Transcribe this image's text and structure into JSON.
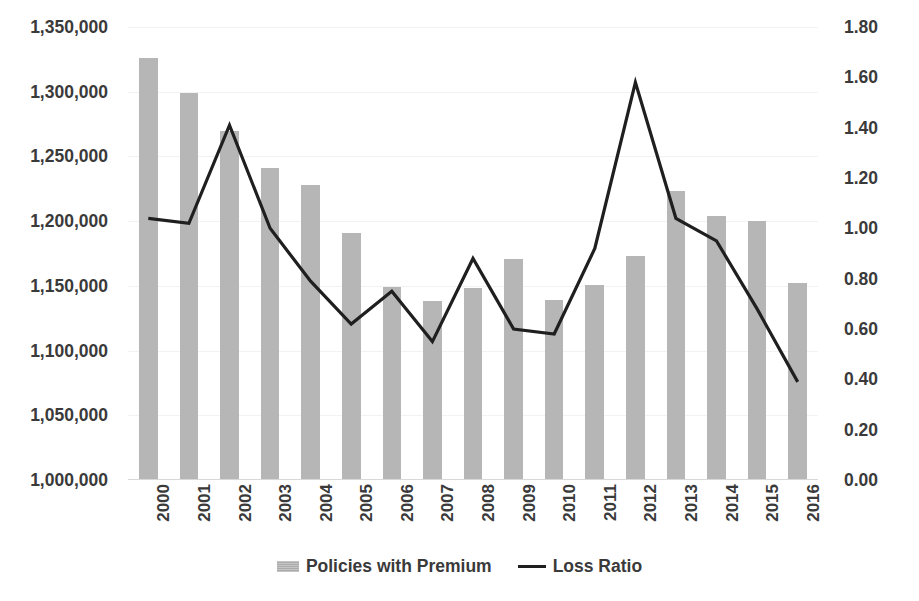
{
  "chart_data": {
    "type": "bar",
    "title": "",
    "xlabel": "",
    "ylabel": "",
    "grid": true,
    "legend_position": "bottom",
    "categories": [
      "2000",
      "2001",
      "2002",
      "2003",
      "2004",
      "2005",
      "2006",
      "2007",
      "2008",
      "2009",
      "2010",
      "2011",
      "2012",
      "2013",
      "2014",
      "2015",
      "2016"
    ],
    "series": [
      {
        "name": "Policies with Premium",
        "type": "bar",
        "axis": "left",
        "color": "#b6b6b6",
        "values": [
          1326000,
          1299000,
          1270000,
          1241000,
          1228000,
          1191000,
          1149000,
          1138000,
          1148000,
          1171000,
          1139000,
          1151000,
          1173000,
          1223000,
          1204000,
          1200000,
          1152000
        ]
      },
      {
        "name": "Loss Ratio",
        "type": "line",
        "axis": "right",
        "color": "#1f1f1f",
        "values": [
          1.04,
          1.02,
          1.41,
          1.0,
          0.79,
          0.62,
          0.75,
          0.55,
          0.88,
          0.6,
          0.58,
          0.92,
          1.58,
          1.04,
          0.95,
          0.68,
          0.39
        ]
      }
    ],
    "y_left": {
      "min": 1000000,
      "max": 1350000,
      "step": 50000,
      "ticks": [
        "1,350,000",
        "1,300,000",
        "1,250,000",
        "1,200,000",
        "1,150,000",
        "1,100,000",
        "1,050,000",
        "1,000,000"
      ],
      "tick_values": [
        1350000,
        1300000,
        1250000,
        1200000,
        1150000,
        1100000,
        1050000,
        1000000
      ]
    },
    "y_right": {
      "min": 0.0,
      "max": 1.8,
      "step": 0.2,
      "ticks": [
        "1.80",
        "1.60",
        "1.40",
        "1.20",
        "1.00",
        "0.80",
        "0.60",
        "0.40",
        "0.20",
        "0.00"
      ],
      "tick_values": [
        1.8,
        1.6,
        1.4,
        1.2,
        1.0,
        0.8,
        0.6,
        0.4,
        0.2,
        0.0
      ]
    }
  },
  "legend": {
    "items": [
      {
        "label": "Policies with Premium",
        "marker": "bar-swatch"
      },
      {
        "label": "Loss Ratio",
        "marker": "line-swatch"
      }
    ]
  },
  "colors": {
    "bar": "#b6b6b6",
    "line": "#1f1f1f",
    "grid": "#f2f2f2",
    "text": "#3a3a3a",
    "background": "#ffffff"
  }
}
